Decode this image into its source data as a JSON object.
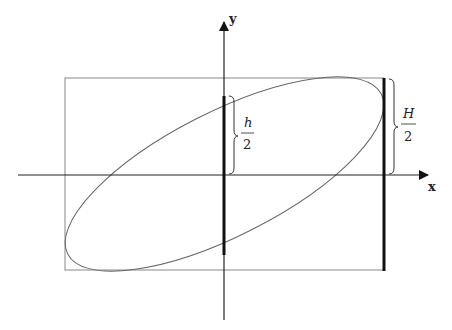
{
  "axes": {
    "x_label": "x",
    "y_label": "y"
  },
  "labels": {
    "small_h": {
      "num": "h",
      "den": "2"
    },
    "big_H": {
      "num": "H",
      "den": "2"
    }
  },
  "colors": {
    "line": "#222222",
    "box": "#888888",
    "ellipse": "#666666"
  }
}
